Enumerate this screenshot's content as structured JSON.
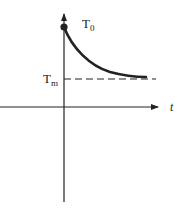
{
  "diagram": {
    "labels": {
      "initial_temp": "T",
      "initial_temp_sub": "0",
      "medium_temp": "T",
      "medium_temp_sub": "m",
      "time_axis": "t"
    },
    "colors": {
      "axis": "#222222",
      "curve": "#222222",
      "dashed": "#222222"
    }
  }
}
